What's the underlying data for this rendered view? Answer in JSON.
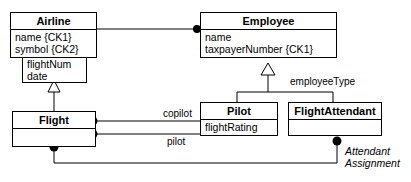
{
  "diagram": {
    "kind": "uml-class-diagram",
    "line_color": "#000000",
    "fill_color": "#ffffff",
    "background": "#ffffff"
  },
  "classes": {
    "airline": {
      "name": "Airline",
      "attributes": [
        "name {CK1}",
        "symbol {CK2}"
      ]
    },
    "flight_assoc_attrs": {
      "name": "",
      "attributes": [
        "flightNum",
        "date"
      ]
    },
    "employee": {
      "name": "Employee",
      "attributes": [
        "name",
        "taxpayerNumber {CK1}"
      ]
    },
    "flight": {
      "name": "Flight",
      "attributes": []
    },
    "pilot": {
      "name": "Pilot",
      "attributes": [
        "flightRating"
      ]
    },
    "flight_attendant": {
      "name": "FlightAttendant",
      "attributes": []
    }
  },
  "edge_labels": {
    "employee_type": "employeeType",
    "copilot": "copilot",
    "pilot": "pilot",
    "attendant_assignment_line1": "Attendant",
    "attendant_assignment_line2": "Assignment"
  },
  "relationships": [
    {
      "name": "airline-employs-employee",
      "from": "Airline",
      "to": "Employee",
      "type": "association",
      "source_end": "plain",
      "target_end": "filled-dot",
      "label": ""
    },
    {
      "name": "employee-generalization",
      "from": "Employee",
      "to": "Pilot, FlightAttendant",
      "type": "generalization",
      "discriminator": "employeeType"
    },
    {
      "name": "flight-generalization-to-association-attrs",
      "from": "Flight",
      "to": "flightNum/date",
      "type": "generalization"
    },
    {
      "name": "flight-copilot-pilot",
      "from": "Flight",
      "to": "Pilot",
      "type": "association",
      "source_end": "filled-dot",
      "label": "copilot"
    },
    {
      "name": "flight-pilot-pilot",
      "from": "Flight",
      "to": "Pilot",
      "type": "association",
      "source_end": "filled-dot",
      "label": "pilot"
    },
    {
      "name": "flight-attendant-assignment",
      "from": "Flight",
      "to": "FlightAttendant",
      "type": "association",
      "source_end": "filled-dot",
      "target_end": "filled-dot",
      "label": "Attendant Assignment"
    }
  ]
}
